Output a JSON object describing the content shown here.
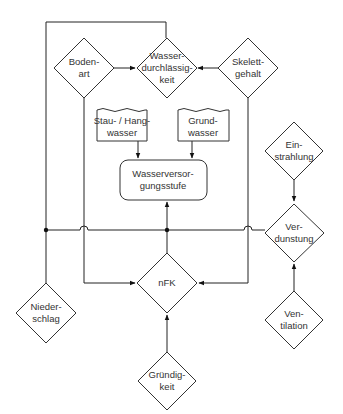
{
  "diagram": {
    "nodes": {
      "bodenart": {
        "label": "Boden-\nart",
        "shape": "diamond"
      },
      "wasserdurchlaessigkeit": {
        "label": "Wasser-\ndurchlässig-\nkeit",
        "shape": "diamond"
      },
      "skelettgehalt": {
        "label": "Skelett-\ngehalt",
        "shape": "diamond"
      },
      "stau_hangwasser": {
        "label": "Stau- / Hang-\nwasser",
        "shape": "document"
      },
      "grundwasser": {
        "label": "Grund-\nwasser",
        "shape": "document"
      },
      "wasserversorgungsstufe": {
        "label": "Wasserversor-\ngungsstufe",
        "shape": "rounded-rect"
      },
      "einstrahlung": {
        "label": "Ein-\nstrahlung",
        "shape": "diamond"
      },
      "verdunstung": {
        "label": "Ver-\ndunstung",
        "shape": "diamond"
      },
      "nfk": {
        "label": "nFK",
        "shape": "diamond"
      },
      "niederschlag": {
        "label": "Nieder-\nschlag",
        "shape": "diamond"
      },
      "ventilation": {
        "label": "Ven-\ntilation",
        "shape": "diamond"
      },
      "gruendigkeit": {
        "label": "Gründig-\nkeit",
        "shape": "diamond"
      }
    },
    "edges": [
      {
        "from": "Bodenart",
        "to": "Wasserdurchlässigkeit"
      },
      {
        "from": "Skelettgehalt",
        "to": "Wasserdurchlässigkeit"
      },
      {
        "from": "Niederschlag",
        "to": "Wasserdurchlässigkeit"
      },
      {
        "from": "Stau- / Hangwasser",
        "to": "Wasserversorgungsstufe"
      },
      {
        "from": "Grundwasser",
        "to": "Wasserversorgungsstufe"
      },
      {
        "from": "Bodenart",
        "to": "nFK"
      },
      {
        "from": "Skelettgehalt",
        "to": "nFK"
      },
      {
        "from": "Niederschlag / Verdunstung / nFK junction",
        "to": "Wasserversorgungsstufe"
      },
      {
        "from": "Einstrahlung",
        "to": "Verdunstung"
      },
      {
        "from": "Ventilation",
        "to": "Verdunstung"
      },
      {
        "from": "Gründigkeit",
        "to": "nFK"
      }
    ],
    "colors": {
      "stroke": "#333333",
      "background": "#ffffff",
      "text": "#333333"
    }
  }
}
